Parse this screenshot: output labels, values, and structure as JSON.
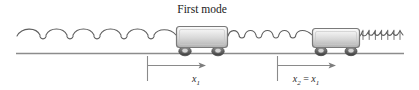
{
  "figure": {
    "title": "First mode",
    "background_color": "#ffffff",
    "line_color": "#6b6b6b",
    "dark_line_color": "#4a4a4a"
  },
  "walls": {
    "left": {
      "name": "left-wall",
      "x": 16,
      "y_top": 12,
      "y_bottom": 53
    },
    "right": {
      "name": "right-wall",
      "x": 404,
      "y_top": 12,
      "y_bottom": 53
    },
    "ground": {
      "name": "ground-line",
      "x_start": 16,
      "x_end": 404,
      "y": 53
    }
  },
  "springs": [
    {
      "name": "spring-left",
      "state": "stretched",
      "coils": 6,
      "x_start": 17,
      "x_end": 177
    },
    {
      "name": "spring-middle",
      "state": "neutral",
      "coils": 8,
      "x_start": 228,
      "x_end": 312
    },
    {
      "name": "spring-right",
      "state": "compressed",
      "coils": 9,
      "x_start": 374,
      "x_end": 403
    }
  ],
  "carts": [
    {
      "name": "cart-1",
      "label": "mass 1",
      "x": 176,
      "y": 26,
      "width": 52,
      "height": 21
    },
    {
      "name": "cart-2",
      "label": "mass 2",
      "x": 312,
      "y": 28,
      "width": 48,
      "height": 19
    }
  ],
  "dimensions": [
    {
      "name": "displacement-x1",
      "label_main": "x",
      "label_sub": "1",
      "label_full": "x₁",
      "tick_x": 147,
      "arrow_end_x": 206,
      "y": 65,
      "label_x": 196,
      "label_y": 82
    },
    {
      "name": "displacement-x2",
      "label_main": "x",
      "label_sub": "2",
      "label_eq": " = ",
      "label_main2": "x",
      "label_sub2": "1",
      "label_full": "x₂ = x₁",
      "tick_x": 277,
      "arrow_end_x": 336,
      "y": 65,
      "label_x": 306,
      "label_y": 82
    }
  ],
  "title_position": {
    "x": 202,
    "y": 12
  }
}
